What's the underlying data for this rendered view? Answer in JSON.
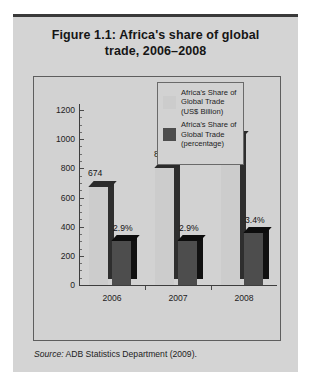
{
  "figure": {
    "title": "Figure 1.1:  Africa's share of global trade, 2006–2008",
    "title_line1": "Figure 1.1:  Africa's share of global",
    "title_line2": "trade, 2006–2008",
    "source_prefix": "Source:",
    "source_text": " ADB Statistics Department (2009)."
  },
  "colors": {
    "panel_background": "#d4d4d4",
    "plot_background": "#d2d2d2",
    "series_light": "#cccccc",
    "series_light_side": "#2e2e2e",
    "series_dark": "#4d4d4d",
    "series_dark_side": "#111111",
    "axis": "#3d3d3d",
    "text": "#1d1d1d",
    "top_rule": "#3a3a3a"
  },
  "legend": {
    "items": [
      {
        "swatch_color": "#cccccc",
        "lines": [
          "Africa's Share of",
          "Global Trade",
          "(US$ Billion)"
        ]
      },
      {
        "swatch_color": "#4d4d4d",
        "lines": [
          "Africa's Share of",
          "Global Trade",
          "(percentage)"
        ]
      }
    ]
  },
  "chart_data": {
    "type": "bar",
    "title": "Figure 1.1: Africa's share of global trade, 2006–2008",
    "xlabel": "",
    "ylabel": "",
    "categories": [
      "2006",
      "2007",
      "2008"
    ],
    "ylim": [
      0,
      1200
    ],
    "yticks": [
      0,
      200,
      400,
      600,
      800,
      1000,
      1200
    ],
    "ytick_labels": [
      "0",
      "200",
      "400",
      "600",
      "800",
      "1000",
      "1200"
    ],
    "minor_ticks": true,
    "grid": false,
    "legend_position": "inside-top-right",
    "series": [
      {
        "name": "Africa's Share of Global Trade (US$ Billion)",
        "color": "#cccccc",
        "values": [
          674,
          805,
          1015
        ],
        "data_labels": [
          "674",
          "805",
          "1015"
        ]
      },
      {
        "name": "Africa's Share of Global Trade (percentage)",
        "color": "#4d4d4d",
        "values": [
          2.9,
          2.9,
          3.4
        ],
        "plotted_heights": [
          300,
          300,
          355
        ],
        "data_labels": [
          "2.9%",
          "2.9%",
          "3.4%"
        ]
      }
    ]
  }
}
